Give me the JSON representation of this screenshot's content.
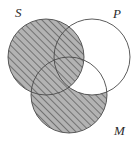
{
  "figure": {
    "type": "venn-diagram",
    "background_color": "#ffffff",
    "stroke_color": "#4a4a4a",
    "stroke_width": 0.9,
    "shade_fill_color": "#b3b3b3",
    "hatch_color": "#3c3c3c",
    "hatch_angle_deg": 45,
    "hatch_spacing_px": 5,
    "width": 138,
    "height": 145
  },
  "circles": [
    {
      "id": "S",
      "label": "S",
      "cx": 46,
      "cy": 57,
      "r": 38
    },
    {
      "id": "P",
      "label": "P",
      "cx": 92,
      "cy": 57,
      "r": 38
    },
    {
      "id": "M",
      "label": "M",
      "cx": 69,
      "cy": 95,
      "r": 38
    }
  ],
  "labels": {
    "s": "S",
    "p": "P",
    "m": "M"
  },
  "shading": {
    "description": "Shaded (hatched) region is all of S together with the part of M outside P",
    "shaded_regions": [
      "S-only",
      "S-and-P-only",
      "S-and-M-only",
      "S-and-P-and-M",
      "M-only"
    ],
    "unshaded_regions": [
      "P-only",
      "P-and-M-only"
    ],
    "shaded_region_count": 5,
    "unshaded_region_count": 2
  }
}
